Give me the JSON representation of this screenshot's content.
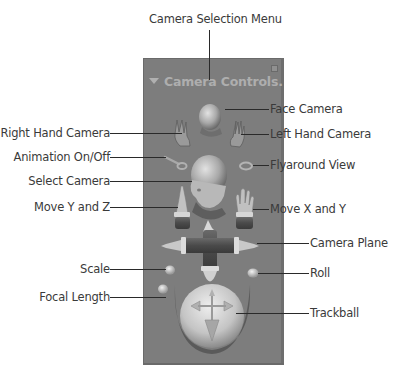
{
  "panel": {
    "title": "Camera Controls.",
    "background_color": "#7d7d7d",
    "title_color": "#aeaeae"
  },
  "callouts": {
    "camera_selection_menu": "Camera Selection Menu",
    "face_camera": "Face Camera",
    "right_hand_camera": "Right Hand Camera",
    "left_hand_camera": "Left Hand Camera",
    "animation_on_off": "Animation On/Off",
    "flyaround_view": "Flyaround View",
    "select_camera": "Select Camera",
    "move_y_and_z": "Move Y and Z",
    "move_x_and_y": "Move X and Y",
    "camera_plane": "Camera Plane",
    "scale": "Scale",
    "roll": "Roll",
    "focal_length": "Focal Length",
    "trackball": "Trackball"
  },
  "controls": [
    {
      "id": "camera-selection-menu",
      "icon": "triangle-menu-icon"
    },
    {
      "id": "face-camera",
      "icon": "face-head-icon"
    },
    {
      "id": "right-hand-camera",
      "icon": "right-hand-icon"
    },
    {
      "id": "left-hand-camera",
      "icon": "left-hand-icon"
    },
    {
      "id": "animation-toggle",
      "icon": "key-spoon-icon"
    },
    {
      "id": "flyaround-view",
      "icon": "ring-icon"
    },
    {
      "id": "select-camera",
      "icon": "bald-head-icon"
    },
    {
      "id": "move-y-z",
      "icon": "pointing-finger-icon"
    },
    {
      "id": "move-x-y",
      "icon": "open-hand-icon"
    },
    {
      "id": "camera-plane",
      "icon": "cross-fingers-icon"
    },
    {
      "id": "scale",
      "icon": "small-sphere-icon"
    },
    {
      "id": "roll",
      "icon": "small-sphere-icon"
    },
    {
      "id": "focal-length",
      "icon": "small-sphere-icon"
    },
    {
      "id": "trackball",
      "icon": "trackball-sphere-icon"
    }
  ]
}
